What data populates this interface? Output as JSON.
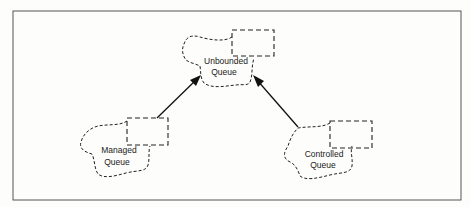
{
  "diagram": {
    "nodes": [
      {
        "id": "unbounded",
        "label_lines": [
          "Unbounded",
          "Queue"
        ]
      },
      {
        "id": "managed",
        "label_lines": [
          "Managed",
          "Queue"
        ]
      },
      {
        "id": "controlled",
        "label_lines": [
          "Controlled",
          "Queue"
        ]
      }
    ],
    "edges": [
      {
        "from": "managed",
        "to": "unbounded",
        "style": "solid-arrow"
      },
      {
        "from": "controlled",
        "to": "unbounded",
        "style": "solid-arrow"
      }
    ],
    "colors": {
      "line": "#111111",
      "frame": "#555555",
      "background": "#fdfdfb"
    }
  }
}
